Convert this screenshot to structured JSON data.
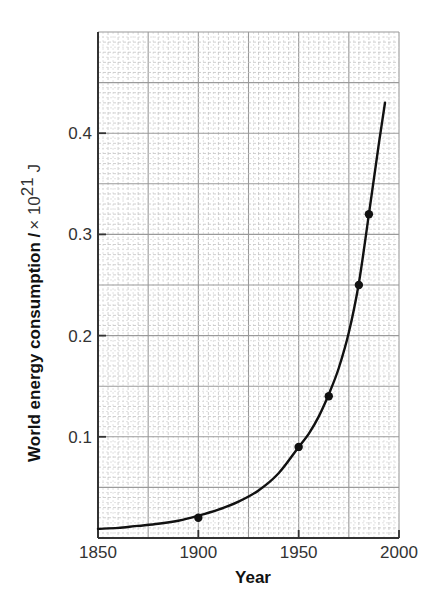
{
  "chart_data": {
    "type": "line",
    "title": "",
    "xlabel": "Year",
    "ylabel": "World energy consumption",
    "ylabel_unit": "/ × 10²¹ J",
    "xlim": [
      1850,
      2000
    ],
    "ylim": [
      0,
      0.5
    ],
    "x_ticks": [
      1850,
      1900,
      1950,
      2000
    ],
    "y_ticks": [
      0.1,
      0.2,
      0.3,
      0.4
    ],
    "x_tick_labels": [
      "1850",
      "1900",
      "1950",
      "2000"
    ],
    "y_tick_labels": [
      "0.1",
      "0.2",
      "0.3",
      "0.4"
    ],
    "grid": true,
    "grid_style": "graph paper (major every 25 years / 0.05, minor every 5 years / 0.01)",
    "legend": null,
    "series": [
      {
        "name": "World energy consumption",
        "kind": "points",
        "x": [
          1900,
          1950,
          1965,
          1980,
          1985
        ],
        "y": [
          0.02,
          0.09,
          0.14,
          0.25,
          0.32
        ]
      },
      {
        "name": "Smooth fitted curve",
        "kind": "curve",
        "x": [
          1850,
          1860,
          1870,
          1880,
          1890,
          1900,
          1910,
          1920,
          1930,
          1940,
          1950,
          1955,
          1960,
          1965,
          1970,
          1975,
          1980,
          1985,
          1990,
          1993
        ],
        "y": [
          0.009,
          0.01,
          0.012,
          0.014,
          0.017,
          0.022,
          0.028,
          0.036,
          0.047,
          0.064,
          0.09,
          0.103,
          0.12,
          0.142,
          0.168,
          0.203,
          0.252,
          0.32,
          0.39,
          0.43
        ]
      }
    ]
  },
  "axes": {
    "x_title": "Year",
    "y_title_bold": "World energy consumption /",
    "y_title_unit_prefix": "× 10",
    "y_title_unit_exp": "21",
    "y_title_unit_suffix": " J"
  },
  "colors": {
    "line": "#111111",
    "axis": "#333333",
    "grid_major": "#9a9a9a",
    "grid_minor": "#c4c4c4",
    "grid_dotted": "#d6d6d6"
  }
}
